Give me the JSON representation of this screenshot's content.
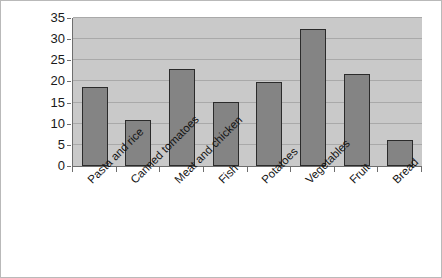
{
  "chart_data": {
    "type": "bar",
    "title": "",
    "subtitle": "",
    "xlabel": "",
    "ylabel": "",
    "categories": [
      "Pasta and rice",
      "Canned tomatoes",
      "Meat and chicken",
      "Fish",
      "Potatoes",
      "Vegetables",
      "Fruit",
      "Bread"
    ],
    "values": [
      18.7,
      10.8,
      23.0,
      15.2,
      19.8,
      32.5,
      21.8,
      6.2
    ],
    "ylim": [
      0,
      35
    ],
    "yticks": [
      0,
      5,
      10,
      15,
      20,
      25,
      30,
      35
    ],
    "ytick_labels": [
      "0",
      "5",
      "10",
      "15",
      "20",
      "25",
      "30",
      "35"
    ],
    "grid": true,
    "grid_axis": "y",
    "legend": false,
    "legend_position": "none",
    "bar_color": "#848484",
    "bar_edge_color": "#2b2b2b",
    "plot_background_color": "#c9c9c9",
    "figure_background_color": "#ffffff",
    "gridline_color": "#a9a9a9",
    "axis_color": "#6e6e6e",
    "xtick_label_rotation": -45
  }
}
